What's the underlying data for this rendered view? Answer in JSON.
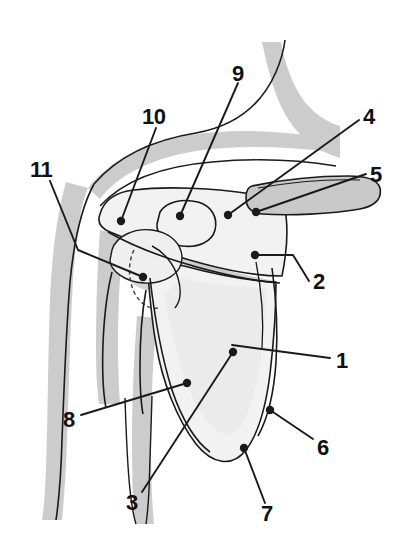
{
  "figure": {
    "type": "labeled-anatomical-illustration",
    "width": 403,
    "height": 554,
    "background_color": "#ffffff",
    "line_color": "#1a1a1a",
    "soft_tissue_fill": "#cccccc",
    "bone_fill": "#f2f2f2",
    "bone_shadow_fill": "#e2e2e2",
    "clavicle_fill": "#c9c9c9",
    "label_color": "#111111"
  },
  "labels": [
    {
      "id": "1",
      "text": "1",
      "x": 336,
      "y": 350,
      "anchor_x": 232,
      "anchor_y": 345,
      "has_dot": false
    },
    {
      "id": "2",
      "text": "2",
      "x": 313,
      "y": 271,
      "anchor_x": 255,
      "anchor_y": 255,
      "has_dot": true
    },
    {
      "id": "3",
      "text": "3",
      "x": 126,
      "y": 492,
      "anchor_x": 233,
      "anchor_y": 352,
      "has_dot": true
    },
    {
      "id": "4",
      "text": "4",
      "x": 363,
      "y": 106,
      "anchor_x": 228,
      "anchor_y": 215,
      "has_dot": true
    },
    {
      "id": "5",
      "text": "5",
      "x": 370,
      "y": 164,
      "anchor_x": 256,
      "anchor_y": 212,
      "has_dot": true
    },
    {
      "id": "6",
      "text": "6",
      "x": 317,
      "y": 437,
      "anchor_x": 270,
      "anchor_y": 410,
      "has_dot": true
    },
    {
      "id": "7",
      "text": "7",
      "x": 261,
      "y": 503,
      "anchor_x": 244,
      "anchor_y": 448,
      "has_dot": true
    },
    {
      "id": "8",
      "text": "8",
      "x": 63,
      "y": 409,
      "anchor_x": 187,
      "anchor_y": 383,
      "has_dot": true
    },
    {
      "id": "9",
      "text": "9",
      "x": 232,
      "y": 63,
      "anchor_x": 180,
      "anchor_y": 216,
      "has_dot": true
    },
    {
      "id": "10",
      "text": "10",
      "x": 142,
      "y": 106,
      "anchor_x": 121,
      "anchor_y": 221,
      "has_dot": true
    },
    {
      "id": "11",
      "text": "11",
      "x": 30,
      "y": 159,
      "anchor_x": 143,
      "anchor_y": 277,
      "has_dot": true
    }
  ]
}
